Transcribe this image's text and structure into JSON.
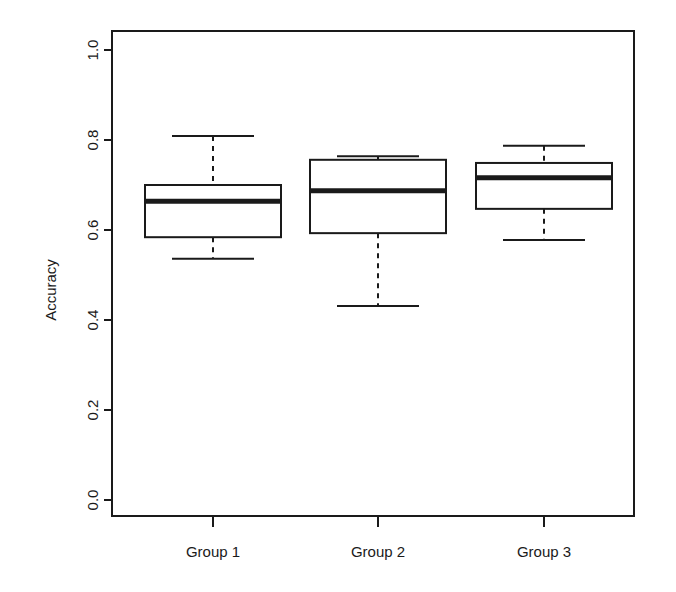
{
  "chart_data": {
    "type": "box",
    "title": "",
    "subtitle": "",
    "xlabel": "",
    "ylabel": "Accuracy",
    "categories": [
      "Group 1",
      "Group 2",
      "Group 3"
    ],
    "ylim": [
      0.0,
      1.0
    ],
    "y_ticks": [
      "0.0",
      "0.2",
      "0.4",
      "0.6",
      "0.8",
      "1.0"
    ],
    "y_tick_values": [
      0.0,
      0.2,
      0.4,
      0.6,
      0.8,
      1.0
    ],
    "grid": false,
    "legend": "none",
    "box_color": "#ffffff",
    "line_color": "#1a1a1a",
    "series": [
      {
        "name": "Group 1",
        "min": 0.536,
        "q1": 0.584,
        "median": 0.664,
        "q3": 0.7,
        "max": 0.809,
        "outliers": []
      },
      {
        "name": "Group 2",
        "min": 0.431,
        "q1": 0.593,
        "median": 0.687,
        "q3": 0.756,
        "max": 0.764,
        "outliers": []
      },
      {
        "name": "Group 3",
        "min": 0.578,
        "q1": 0.647,
        "median": 0.716,
        "q3": 0.749,
        "max": 0.787,
        "outliers": []
      }
    ]
  },
  "axis": {
    "y_label": "Accuracy",
    "y_tick_0": "0.0",
    "y_tick_1": "0.2",
    "y_tick_2": "0.4",
    "y_tick_3": "0.6",
    "y_tick_4": "0.8",
    "y_tick_5": "1.0",
    "x_tick_0": "Group 1",
    "x_tick_1": "Group 2",
    "x_tick_2": "Group 3"
  }
}
